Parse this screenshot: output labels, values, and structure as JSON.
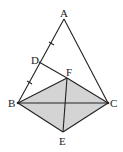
{
  "diagram": {
    "type": "geometry",
    "points": {
      "A": {
        "label": "A",
        "x": 64,
        "y": 19,
        "lx": 60,
        "ly": 17
      },
      "B": {
        "label": "B",
        "x": 18,
        "y": 103,
        "lx": 8,
        "ly": 107
      },
      "C": {
        "label": "C",
        "x": 108,
        "y": 103,
        "lx": 110,
        "ly": 107
      },
      "D": {
        "label": "D",
        "x": 39,
        "y": 62,
        "lx": 31,
        "ly": 64
      },
      "E": {
        "label": "E",
        "x": 63,
        "y": 132,
        "lx": 59,
        "ly": 145
      },
      "F": {
        "label": "F",
        "x": 67,
        "y": 78,
        "lx": 66,
        "ly": 76
      }
    },
    "shaded_region": [
      "B",
      "F",
      "C",
      "E"
    ],
    "shade_color": "#d4d4d4",
    "line_color": "#222222",
    "segments": [
      "AB",
      "AC",
      "DF",
      "BF",
      "FC",
      "BC",
      "BE",
      "EC",
      "FE"
    ],
    "tick_marks": [
      "AD",
      "DB"
    ]
  }
}
